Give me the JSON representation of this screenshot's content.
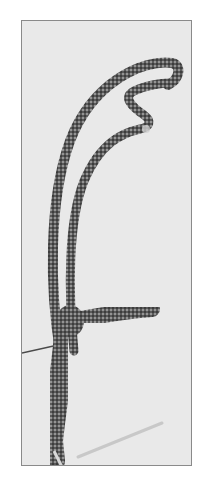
{
  "image": {
    "description": "Grayscale photograph of a crocheted cord shaped into a branching antler/letter-f-like form on a light gray background within a thin dark frame",
    "colors": {
      "background": "#ffffff",
      "frame_fill": "#e9e9e9",
      "frame_border": "#8a8a8a",
      "cord_dark": "#3a3a3a",
      "cord_mid": "#6e6e6e",
      "cord_light": "#b5b5b5",
      "thread": "#4a4a4a",
      "needle": "#c8c8c8"
    }
  }
}
